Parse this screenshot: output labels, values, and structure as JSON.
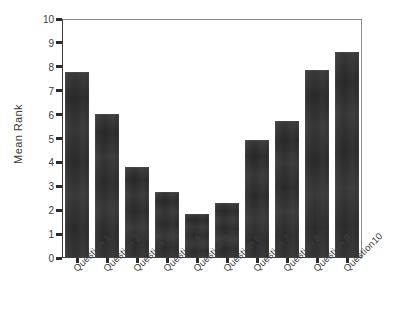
{
  "chart_data": {
    "type": "bar",
    "title": "",
    "xlabel": "",
    "ylabel": "Mean Rank",
    "ylim": [
      0,
      10
    ],
    "ytick_labels": [
      "10",
      "9",
      "8",
      "7",
      "6",
      "5",
      "4",
      "3",
      "2",
      "1",
      "0"
    ],
    "yticks": [
      10,
      9,
      8,
      7,
      6,
      5,
      4,
      3,
      2,
      1,
      0
    ],
    "grid": false,
    "legend": "none",
    "bar_color": "#2e2e2e",
    "categories": [
      "Question 1",
      "Question 2",
      "Question 3",
      "Question 4",
      "Question 5",
      "Question 6",
      "Question 7",
      "Question 8",
      "Question 9",
      "Question10"
    ],
    "values": [
      7.78,
      6.02,
      3.82,
      2.77,
      1.83,
      2.29,
      4.95,
      5.74,
      7.88,
      8.62
    ]
  }
}
